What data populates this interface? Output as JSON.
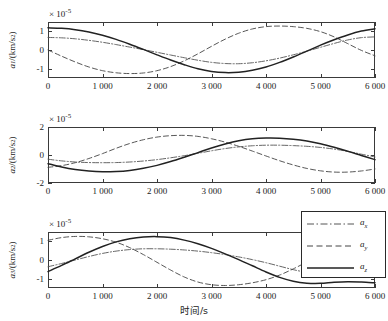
{
  "chart_data": {
    "type": "line",
    "title": "",
    "xlabel": "时间/s",
    "xlim": [
      0,
      6000
    ],
    "xticks": [
      0,
      1000,
      2000,
      3000,
      4000,
      5000,
      6000
    ],
    "xticklabels": [
      "0",
      "1 000",
      "2 000",
      "3 000",
      "4 000",
      "5 000",
      "6 000"
    ],
    "grid": false,
    "legend_position": "lower-right-of-third-subplot",
    "legend": [
      {
        "label": "a",
        "sub": "x",
        "style": "dash-dot"
      },
      {
        "label": "a",
        "sub": "y",
        "style": "dashed"
      },
      {
        "label": "a",
        "sub": "z",
        "style": "solid"
      }
    ],
    "subplots": [
      {
        "id": "subplot-1",
        "ylabel": "a",
        "ylabel_sub": "1",
        "ylabel_unit": "/(km/s",
        "ylabel_exp": "2",
        "ylabel_tail": ")",
        "exponent_note": "× 10",
        "exponent_value": "-5",
        "ylim": [
          -1.45,
          1.45
        ],
        "yticks": [
          1,
          0,
          -1
        ],
        "yticklabels": [
          "1",
          "0",
          "-1"
        ],
        "series": [
          {
            "name": "a_x",
            "style": "dash-dot",
            "x": [
              0,
              250,
              500,
              750,
              1000,
              1250,
              1500,
              1750,
              2000,
              2250,
              2500,
              2750,
              3000,
              3250,
              3500,
              3750,
              4000,
              4250,
              4500,
              4750,
              5000,
              5250,
              5500,
              5750,
              6000
            ],
            "y": [
              0.65,
              0.63,
              0.58,
              0.5,
              0.4,
              0.28,
              0.15,
              0.02,
              -0.12,
              -0.26,
              -0.4,
              -0.53,
              -0.64,
              -0.7,
              -0.71,
              -0.66,
              -0.56,
              -0.42,
              -0.25,
              -0.06,
              0.14,
              0.34,
              0.52,
              0.64,
              0.68
            ]
          },
          {
            "name": "a_y",
            "style": "dashed",
            "x": [
              0,
              250,
              500,
              750,
              1000,
              1250,
              1500,
              1750,
              2000,
              2250,
              2500,
              2750,
              3000,
              3250,
              3500,
              3750,
              4000,
              4250,
              4500,
              4750,
              5000,
              5250,
              5500,
              5750,
              6000
            ],
            "y": [
              0.0,
              -0.32,
              -0.62,
              -0.88,
              -1.07,
              -1.18,
              -1.22,
              -1.19,
              -1.07,
              -0.86,
              -0.56,
              -0.2,
              0.19,
              0.56,
              0.87,
              1.09,
              1.21,
              1.24,
              1.21,
              1.12,
              0.95,
              0.68,
              0.33,
              -0.02,
              -0.3
            ]
          },
          {
            "name": "a_z",
            "style": "solid",
            "x": [
              0,
              250,
              500,
              750,
              1000,
              1250,
              1500,
              1750,
              2000,
              2250,
              2500,
              2750,
              3000,
              3250,
              3500,
              3750,
              4000,
              4250,
              4500,
              4750,
              5000,
              5250,
              5500,
              5750,
              6000
            ],
            "y": [
              1.15,
              1.12,
              1.05,
              0.93,
              0.76,
              0.55,
              0.3,
              0.03,
              -0.25,
              -0.52,
              -0.76,
              -0.97,
              -1.11,
              -1.17,
              -1.15,
              -1.05,
              -0.88,
              -0.64,
              -0.36,
              -0.06,
              0.25,
              0.53,
              0.78,
              0.98,
              1.1
            ]
          }
        ]
      },
      {
        "id": "subplot-2",
        "ylabel": "a",
        "ylabel_sub": "2",
        "ylabel_unit": "/(km/s",
        "ylabel_exp": "2",
        "ylabel_tail": ")",
        "exponent_note": "× 10",
        "exponent_value": "-5",
        "ylim": [
          -2,
          2
        ],
        "yticks": [
          2,
          0,
          -2
        ],
        "yticklabels": [
          "2",
          "0",
          "-2"
        ],
        "series": [
          {
            "name": "a_x",
            "style": "dash-dot",
            "x": [
              0,
              250,
              500,
              750,
              1000,
              1250,
              1500,
              1750,
              2000,
              2250,
              2500,
              2750,
              3000,
              3250,
              3500,
              3750,
              4000,
              4250,
              4500,
              4750,
              5000,
              5250,
              5500,
              5750,
              6000
            ],
            "y": [
              -0.3,
              -0.42,
              -0.5,
              -0.54,
              -0.55,
              -0.54,
              -0.5,
              -0.43,
              -0.33,
              -0.2,
              -0.05,
              0.12,
              0.3,
              0.46,
              0.58,
              0.66,
              0.7,
              0.7,
              0.67,
              0.62,
              0.54,
              0.42,
              0.26,
              0.06,
              -0.14
            ]
          },
          {
            "name": "a_y",
            "style": "dashed",
            "x": [
              0,
              250,
              500,
              750,
              1000,
              1250,
              1500,
              1750,
              2000,
              2250,
              2500,
              2750,
              3000,
              3250,
              3500,
              3750,
              4000,
              4250,
              4500,
              4750,
              5000,
              5250,
              5500,
              5750,
              6000
            ],
            "y": [
              -0.88,
              -0.76,
              -0.55,
              -0.25,
              0.1,
              0.48,
              0.82,
              1.09,
              1.28,
              1.38,
              1.4,
              1.33,
              1.16,
              0.92,
              0.62,
              0.28,
              -0.07,
              -0.41,
              -0.71,
              -0.96,
              -1.13,
              -1.22,
              -1.22,
              -1.14,
              -1.0
            ]
          },
          {
            "name": "a_z",
            "style": "solid",
            "x": [
              0,
              250,
              500,
              750,
              1000,
              1250,
              1500,
              1750,
              2000,
              2250,
              2500,
              2750,
              3000,
              3250,
              3500,
              3750,
              4000,
              4250,
              4500,
              4750,
              5000,
              5250,
              5500,
              5750,
              6000
            ],
            "y": [
              -0.62,
              -0.86,
              -1.04,
              -1.15,
              -1.2,
              -1.18,
              -1.1,
              -0.95,
              -0.74,
              -0.47,
              -0.16,
              0.17,
              0.5,
              0.79,
              1.02,
              1.16,
              1.21,
              1.2,
              1.13,
              1.0,
              0.8,
              0.55,
              0.27,
              -0.03,
              -0.33
            ]
          }
        ]
      },
      {
        "id": "subplot-3",
        "ylabel": "a",
        "ylabel_sub": "3",
        "ylabel_unit": "/(km/s",
        "ylabel_exp": "2",
        "ylabel_tail": ")",
        "exponent_note": "× 10",
        "exponent_value": "-5",
        "ylim": [
          -1.45,
          1.45
        ],
        "yticks": [
          1,
          0,
          -1
        ],
        "yticklabels": [
          "1",
          "0",
          "-1"
        ],
        "series": [
          {
            "name": "a_x",
            "style": "dash-dot",
            "x": [
              0,
              250,
              500,
              750,
              1000,
              1250,
              1500,
              1750,
              2000,
              2250,
              2500,
              2750,
              3000,
              3250,
              3500,
              3750,
              4000,
              4250,
              4500,
              4750,
              5000,
              5250,
              5500,
              5750,
              6000
            ],
            "y": [
              -0.35,
              -0.18,
              0.0,
              0.18,
              0.34,
              0.46,
              0.54,
              0.58,
              0.58,
              0.56,
              0.52,
              0.46,
              0.38,
              0.28,
              0.16,
              0.02,
              -0.14,
              -0.32,
              -0.5,
              -0.64,
              -0.72,
              -0.7,
              -0.58,
              -0.38,
              -0.14
            ]
          },
          {
            "name": "a_y",
            "style": "dashed",
            "x": [
              0,
              250,
              500,
              750,
              1000,
              1250,
              1500,
              1750,
              2000,
              2250,
              2500,
              2750,
              3000,
              3250,
              3500,
              3750,
              4000,
              4250,
              4500,
              4750,
              5000,
              5250,
              5500,
              5750,
              6000
            ],
            "y": [
              1.02,
              1.16,
              1.22,
              1.2,
              1.1,
              0.92,
              0.64,
              0.28,
              -0.12,
              -0.52,
              -0.88,
              -1.14,
              -1.28,
              -1.32,
              -1.28,
              -1.18,
              -1.02,
              -0.78,
              -0.46,
              -0.1,
              0.28,
              0.62,
              0.9,
              1.08,
              1.18
            ]
          },
          {
            "name": "a_z",
            "style": "solid",
            "x": [
              0,
              250,
              500,
              750,
              1000,
              1250,
              1500,
              1750,
              2000,
              2250,
              2500,
              2750,
              3000,
              3250,
              3500,
              3750,
              4000,
              4250,
              4500,
              4750,
              5000,
              5250,
              5500,
              5750,
              6000
            ],
            "y": [
              -0.6,
              -0.28,
              0.06,
              0.4,
              0.7,
              0.94,
              1.1,
              1.19,
              1.21,
              1.16,
              1.03,
              0.84,
              0.6,
              0.32,
              0.02,
              -0.3,
              -0.62,
              -0.9,
              -1.1,
              -1.2,
              -1.21,
              -1.15,
              -1.12,
              -1.14,
              -1.18
            ]
          }
        ]
      }
    ]
  }
}
